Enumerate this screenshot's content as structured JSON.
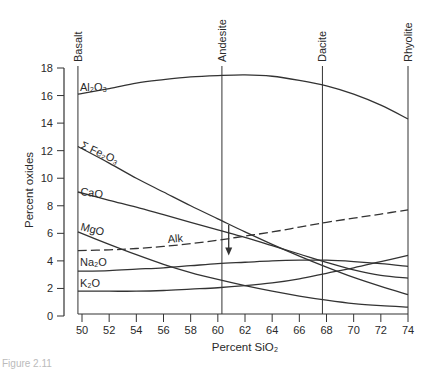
{
  "chart_data": {
    "type": "line",
    "title": "",
    "xlabel": "Percent SiO2",
    "ylabel": "Percent oxides",
    "xlim": [
      49.5,
      74
    ],
    "ylim": [
      0,
      18
    ],
    "x_ticks": [
      50,
      52,
      54,
      56,
      58,
      60,
      62,
      64,
      66,
      68,
      70,
      72,
      74
    ],
    "y_ticks": [
      0,
      2,
      4,
      6,
      8,
      10,
      12,
      14,
      16,
      18
    ],
    "grid": false,
    "legend": "inline labels",
    "rock_types": [
      {
        "name": "Basalt",
        "sio2": 49.7
      },
      {
        "name": "Andesite",
        "sio2": 60.3
      },
      {
        "name": "Dacite",
        "sio2": 67.7
      },
      {
        "name": "Rhyolite",
        "sio2": 74
      }
    ],
    "series": [
      {
        "name": "Al2O3",
        "label": "Al₂O₃",
        "style": "solid",
        "x": [
          49.7,
          52,
          54,
          56,
          58,
          60,
          62,
          64,
          66,
          68,
          70,
          72,
          74
        ],
        "y": [
          16.1,
          16.5,
          16.9,
          17.15,
          17.35,
          17.45,
          17.5,
          17.4,
          17.1,
          16.7,
          16.1,
          15.3,
          14.3
        ]
      },
      {
        "name": "ΣFe2O3",
        "label": "Σ Fe₂O₃",
        "style": "solid",
        "x": [
          49.7,
          52,
          54,
          56,
          58,
          60,
          62,
          64,
          66,
          68,
          70,
          72,
          74
        ],
        "y": [
          12.3,
          11.1,
          10.0,
          9.0,
          8.0,
          7.05,
          6.1,
          5.2,
          4.35,
          3.55,
          2.8,
          2.15,
          1.55
        ]
      },
      {
        "name": "CaO",
        "label": "CaO",
        "style": "solid",
        "x": [
          49.7,
          52,
          54,
          56,
          58,
          60,
          62,
          64,
          66,
          68,
          70,
          72,
          74
        ],
        "y": [
          9.0,
          8.4,
          7.9,
          7.35,
          6.8,
          6.25,
          5.7,
          5.1,
          4.5,
          3.9,
          3.35,
          2.95,
          2.75
        ]
      },
      {
        "name": "MgO",
        "label": "MgO",
        "style": "solid",
        "x": [
          49.7,
          52,
          54,
          56,
          58,
          60,
          62,
          64,
          66,
          68,
          70,
          72,
          74
        ],
        "y": [
          6.1,
          5.2,
          4.45,
          3.75,
          3.15,
          2.65,
          2.2,
          1.8,
          1.45,
          1.15,
          0.9,
          0.75,
          0.65
        ]
      },
      {
        "name": "Alk",
        "label": "Alk",
        "style": "dashed",
        "x": [
          49.7,
          52,
          54,
          56,
          58,
          60,
          62,
          64,
          66,
          68,
          70,
          72,
          74
        ],
        "y": [
          4.75,
          4.8,
          4.9,
          5.05,
          5.25,
          5.5,
          5.8,
          6.1,
          6.45,
          6.8,
          7.1,
          7.4,
          7.7
        ]
      },
      {
        "name": "Na2O",
        "label": "Na₂O",
        "style": "solid",
        "x": [
          49.7,
          52,
          54,
          56,
          58,
          60,
          62,
          64,
          66,
          68,
          70,
          72,
          74
        ],
        "y": [
          3.25,
          3.3,
          3.4,
          3.5,
          3.65,
          3.8,
          3.9,
          4.0,
          4.05,
          4.05,
          3.95,
          3.8,
          3.6
        ]
      },
      {
        "name": "K2O",
        "label": "K₂O",
        "style": "solid",
        "x": [
          49.7,
          52,
          54,
          56,
          58,
          60,
          62,
          64,
          66,
          68,
          70,
          72,
          74
        ],
        "y": [
          1.8,
          1.8,
          1.8,
          1.85,
          1.95,
          2.05,
          2.2,
          2.4,
          2.7,
          3.1,
          3.5,
          3.95,
          4.4
        ]
      }
    ],
    "annotations": [
      {
        "type": "arrow",
        "direction": "down",
        "x": 60.8,
        "y_from": 6.6,
        "y_to": 4.4
      }
    ]
  },
  "labels": {
    "y_axis_title": "Percent  oxides",
    "x_axis_title": "Percent SiO₂",
    "caption": "Figure 2.11"
  }
}
